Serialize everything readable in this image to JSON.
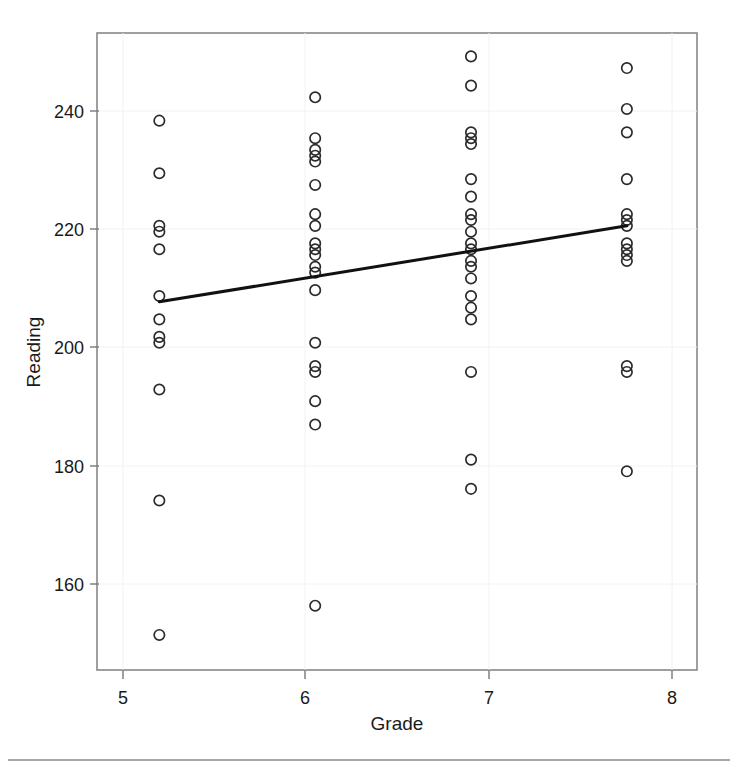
{
  "chart_data": {
    "type": "scatter",
    "title": "",
    "xlabel": "Grade",
    "ylabel": "Reading",
    "xlim": [
      4.6,
      8.45
    ],
    "ylim": [
      143,
      252
    ],
    "xticks": [
      5,
      6,
      7,
      8
    ],
    "xtick_labels": [
      "5",
      "6",
      "7",
      "8"
    ],
    "yticks": [
      160,
      180,
      200,
      220,
      240
    ],
    "ytick_labels": [
      "160",
      "180",
      "200",
      "220",
      "240"
    ],
    "grid": false,
    "legend": null,
    "point_marker": "open-circle",
    "point_color": "#2b2b2b",
    "line_color": "#111111",
    "series": [
      {
        "name": "Grade 5",
        "x": 5,
        "values": [
          237,
          228,
          219,
          218,
          215,
          207,
          203,
          200,
          199,
          191,
          172,
          149
        ]
      },
      {
        "name": "Grade 6",
        "x": 6,
        "values": [
          241,
          234,
          232,
          231,
          230,
          226,
          221,
          219,
          216,
          215,
          214,
          212,
          211,
          208,
          199,
          195,
          194,
          189,
          185,
          154
        ]
      },
      {
        "name": "Grade 7",
        "x": 7,
        "values": [
          248,
          243,
          235,
          234,
          233,
          227,
          224,
          221,
          220,
          218,
          216,
          215,
          213,
          212,
          210,
          207,
          205,
          203,
          194,
          179,
          174
        ]
      },
      {
        "name": "Grade 8",
        "x": 8,
        "values": [
          246,
          239,
          235,
          227,
          221,
          220,
          219,
          216,
          215,
          214,
          213,
          195,
          194,
          177
        ]
      }
    ],
    "fit_line": {
      "name": "regression-line",
      "x_start": 5,
      "y_start": 206,
      "x_end": 8,
      "y_end": 219
    }
  }
}
